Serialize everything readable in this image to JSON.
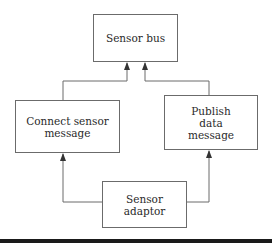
{
  "diagram": {
    "nodes": {
      "sensor_bus": {
        "label": "Sensor bus"
      },
      "connect_sensor_message": {
        "label": "Connect sensor\nmessage"
      },
      "publish_data_message": {
        "label": "Publish\ndata\nmessage"
      },
      "sensor_adaptor": {
        "label": "Sensor\nadaptor"
      }
    },
    "edges": [
      {
        "from": "connect_sensor_message",
        "to": "sensor_bus"
      },
      {
        "from": "publish_data_message",
        "to": "sensor_bus"
      },
      {
        "from": "sensor_adaptor",
        "to": "connect_sensor_message"
      },
      {
        "from": "sensor_adaptor",
        "to": "publish_data_message"
      }
    ],
    "colors": {
      "line": "#6b6b6b",
      "text": "#2a2a2a",
      "bottom_bar": "#1a1a1a"
    }
  }
}
